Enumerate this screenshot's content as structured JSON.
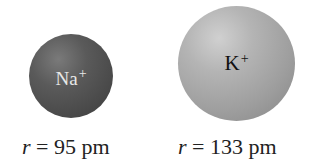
{
  "ions": [
    {
      "symbol": "Na",
      "charge": "+",
      "radius_var": "r",
      "radius_text": " = 95 pm",
      "color": "#555555"
    },
    {
      "symbol": "K",
      "charge": "+",
      "radius_var": "r",
      "radius_text": " = 133 pm",
      "color": "#aaaaaa"
    }
  ]
}
